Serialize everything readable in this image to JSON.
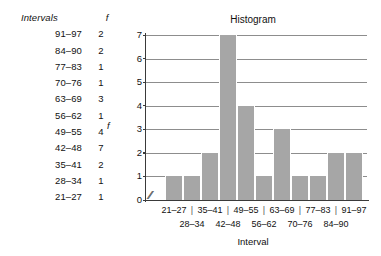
{
  "table": {
    "headers": {
      "interval": "Intervals",
      "frequency": "f"
    },
    "rows": [
      {
        "interval": "91–97",
        "f": "2"
      },
      {
        "interval": "84–90",
        "f": "2"
      },
      {
        "interval": "77–83",
        "f": "1"
      },
      {
        "interval": "70–76",
        "f": "1"
      },
      {
        "interval": "63–69",
        "f": "3"
      },
      {
        "interval": "56–62",
        "f": "1"
      },
      {
        "interval": "49–55",
        "f": "4"
      },
      {
        "interval": "42–48",
        "f": "7"
      },
      {
        "interval": "35–41",
        "f": "2"
      },
      {
        "interval": "28–34",
        "f": "1"
      },
      {
        "interval": "21–27",
        "f": "1"
      }
    ]
  },
  "chart_data": {
    "type": "bar",
    "title": "Histogram",
    "xlabel": "Interval",
    "ylabel": "f",
    "categories": [
      "21–27",
      "28–34",
      "35–41",
      "42–48",
      "49–55",
      "56–62",
      "63–69",
      "70–76",
      "77–83",
      "84–90",
      "91–97"
    ],
    "values": [
      1,
      1,
      2,
      7,
      4,
      1,
      3,
      1,
      1,
      2,
      2
    ],
    "ylim": [
      0,
      7
    ],
    "yticks": [
      "0",
      "1",
      "2",
      "3",
      "4",
      "5",
      "6",
      "7"
    ],
    "grid": true,
    "legend": false,
    "axis_break": "//",
    "bar_color": "#a6a6a6",
    "gridline_color": "#8d8d8d",
    "axis_color": "#3a3a3a",
    "xlabel_separator": "|"
  }
}
